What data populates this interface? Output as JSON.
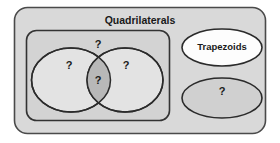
{
  "diagram": {
    "type": "euler-venn",
    "title": "Quadrilaterals",
    "outer_region": {
      "name": "Quadrilaterals",
      "label": "Quadrilaterals",
      "fill": "#d9d9d9",
      "stroke": "#404040"
    },
    "inner_region": {
      "name": "inner-group",
      "label": "",
      "fill": "#d3d3d3",
      "stroke": "#333333"
    },
    "sets": [
      {
        "id": "left-ellipse",
        "label": "?",
        "fill": "#e3e3e3",
        "stroke": "#2b2b2b"
      },
      {
        "id": "right-ellipse",
        "label": "?",
        "fill": "#e3e3e3",
        "stroke": "#2b2b2b"
      },
      {
        "id": "intersection",
        "label": "?",
        "fill": "#b8b8b8",
        "stroke": "#2b2b2b"
      },
      {
        "id": "inner-outside",
        "label": "?",
        "fill": "#d3d3d3",
        "stroke": "none"
      },
      {
        "id": "trapezoids-ellipse",
        "label": "Trapezoids",
        "fill": "#fdfdfd",
        "stroke": "#2b2b2b"
      },
      {
        "id": "unknown-ellipse",
        "label": "?",
        "fill": "#d0d0d0",
        "stroke": "#2b2b2b"
      }
    ],
    "labels": {
      "title": "Quadrilaterals",
      "inner_top_q": "?",
      "left_q": "?",
      "right_q": "?",
      "intersection_q": "?",
      "trapezoids": "Trapezoids",
      "unknown_q": "?"
    },
    "colors": {
      "page_background": "#ffffff",
      "outer_fill": "#d9d9d9",
      "inner_fill": "#d3d3d3",
      "ellipse_fill": "#e3e3e3",
      "overlap_fill": "#b8b8b8",
      "white_fill": "#fdfdfd",
      "gray_ellipse_fill": "#d0d0d0",
      "stroke": "#2b2b2b",
      "text": "#1a1a1a"
    }
  }
}
